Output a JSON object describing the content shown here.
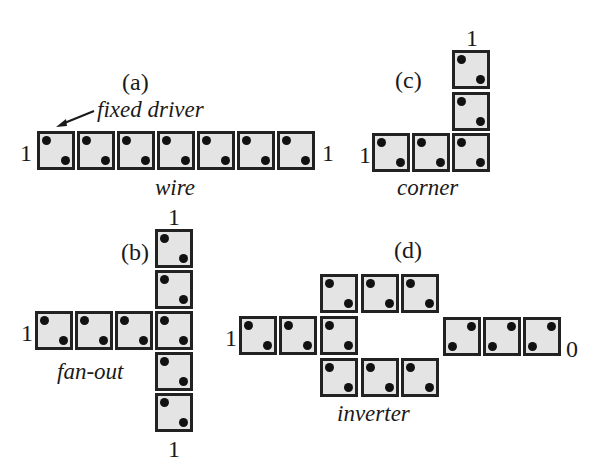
{
  "figure": {
    "panels": [
      {
        "id": "a",
        "label": "(a)",
        "caption": "wire",
        "annotation": "fixed driver",
        "input": "1",
        "output": "1"
      },
      {
        "id": "b",
        "label": "(b)",
        "caption": "fan-out",
        "input": "1",
        "output_top": "1",
        "output_bottom": "1"
      },
      {
        "id": "c",
        "label": "(c)",
        "caption": "corner",
        "input": "1",
        "output": "1"
      },
      {
        "id": "d",
        "label": "(d)",
        "caption": "inverter",
        "input": "1",
        "output": "0"
      }
    ],
    "colors": {
      "cell_fill": "#e4e4e4",
      "cell_border": "#222222",
      "dot": "#111111"
    }
  }
}
